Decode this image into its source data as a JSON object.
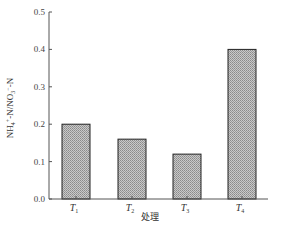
{
  "chart_data": {
    "type": "bar",
    "title": "",
    "xlabel": "处理",
    "ylabel": "NH4+-N/NO3−-N",
    "categories": [
      "T1",
      "T2",
      "T3",
      "T4"
    ],
    "category_labels": [
      {
        "main": "T",
        "sub": "1"
      },
      {
        "main": "T",
        "sub": "2"
      },
      {
        "main": "T",
        "sub": "3"
      },
      {
        "main": "T",
        "sub": "4"
      }
    ],
    "values": [
      0.2,
      0.16,
      0.12,
      0.4
    ],
    "ylim": [
      0.0,
      0.5
    ],
    "yticks": [
      "0.0",
      "0.1",
      "0.2",
      "0.3",
      "0.4",
      "0.5"
    ],
    "grid": false,
    "legend": null,
    "bar_fill": "hatched gray",
    "colors": {
      "bar_fill": "#b8b8b8",
      "bar_edge": "#222222",
      "axis": "#555555"
    }
  },
  "axis": {
    "ylabel_main": "NH",
    "ylabel_sub1": "4",
    "ylabel_sup1": "+",
    "ylabel_mid": "-N/NO",
    "ylabel_sub2": "3",
    "ylabel_sup2": "−",
    "ylabel_end": "-N",
    "xlabel": "处理"
  }
}
